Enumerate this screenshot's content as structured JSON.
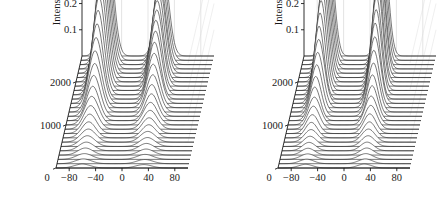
{
  "figure": {
    "background": "#ffffff",
    "panel_count": 2
  },
  "chart_data": [
    {
      "type": "line",
      "subtype": "waterfall-3d",
      "panel": "left",
      "title": "",
      "xlabel": "",
      "ylabel": "Intensity (W)",
      "zlabel": "",
      "xlim": [
        -100,
        100
      ],
      "ylim": [
        0,
        0.45
      ],
      "zlim": [
        0,
        2600
      ],
      "xticks": [
        -80,
        -40,
        0,
        40,
        80
      ],
      "xticklabels": [
        "−80",
        "−40",
        "0",
        "40",
        "80"
      ],
      "yticks": [
        0.1,
        0.2,
        0.3,
        0.4
      ],
      "yticklabels": [
        "0.1",
        "0.2",
        "0.3",
        "0.4"
      ],
      "zticks": [
        0,
        1000,
        2000
      ],
      "zticklabels": [
        "0",
        "1000",
        "2000"
      ],
      "grid": true,
      "legend": null,
      "n_traces": 27,
      "peaks": [
        {
          "name": "left-peak",
          "center": -62,
          "max_amplitude": 0.46,
          "width": 13
        },
        {
          "name": "right-peak",
          "center": 22,
          "max_amplitude": 0.35,
          "width": 13
        }
      ],
      "series_note": "Stacked spectra; each trace offset along the round-trip axis from 0 to 2600.",
      "traces": [
        {
          "z": 0,
          "left_amp": 0.015,
          "left_center": -60,
          "left_width": 17,
          "right_amp": 0.013,
          "right_center": 33,
          "right_width": 17
        },
        {
          "z": 100,
          "left_amp": 0.018,
          "left_center": -60,
          "left_width": 17,
          "right_amp": 0.016,
          "right_center": 33,
          "right_width": 17
        },
        {
          "z": 200,
          "left_amp": 0.022,
          "left_center": -60,
          "left_width": 17,
          "right_amp": 0.019,
          "right_center": 32,
          "right_width": 17
        },
        {
          "z": 300,
          "left_amp": 0.027,
          "left_center": -60,
          "left_width": 16,
          "right_amp": 0.023,
          "right_center": 32,
          "right_width": 16
        },
        {
          "z": 400,
          "left_amp": 0.033,
          "left_center": -60,
          "left_width": 16,
          "right_amp": 0.028,
          "right_center": 31,
          "right_width": 16
        },
        {
          "z": 500,
          "left_amp": 0.041,
          "left_center": -60,
          "left_width": 16,
          "right_amp": 0.034,
          "right_center": 31,
          "right_width": 16
        },
        {
          "z": 600,
          "left_amp": 0.05,
          "left_center": -60,
          "left_width": 16,
          "right_amp": 0.041,
          "right_center": 30,
          "right_width": 16
        },
        {
          "z": 700,
          "left_amp": 0.061,
          "left_center": -61,
          "left_width": 15,
          "right_amp": 0.05,
          "right_center": 30,
          "right_width": 15
        },
        {
          "z": 800,
          "left_amp": 0.074,
          "left_center": -61,
          "left_width": 15,
          "right_amp": 0.06,
          "right_center": 29,
          "right_width": 15
        },
        {
          "z": 900,
          "left_amp": 0.09,
          "left_center": -61,
          "left_width": 15,
          "right_amp": 0.072,
          "right_center": 29,
          "right_width": 15
        },
        {
          "z": 1000,
          "left_amp": 0.109,
          "left_center": -61,
          "left_width": 15,
          "right_amp": 0.086,
          "right_center": 28,
          "right_width": 15
        },
        {
          "z": 1100,
          "left_amp": 0.131,
          "left_center": -61,
          "left_width": 14,
          "right_amp": 0.102,
          "right_center": 28,
          "right_width": 14
        },
        {
          "z": 1200,
          "left_amp": 0.156,
          "left_center": -61,
          "left_width": 14,
          "right_amp": 0.121,
          "right_center": 27,
          "right_width": 14
        },
        {
          "z": 1300,
          "left_amp": 0.185,
          "left_center": -61,
          "left_width": 14,
          "right_amp": 0.142,
          "right_center": 27,
          "right_width": 14
        },
        {
          "z": 1400,
          "left_amp": 0.217,
          "left_center": -62,
          "left_width": 14,
          "right_amp": 0.166,
          "right_center": 26,
          "right_width": 14
        },
        {
          "z": 1500,
          "left_amp": 0.251,
          "left_center": -62,
          "left_width": 14,
          "right_amp": 0.191,
          "right_center": 26,
          "right_width": 14
        },
        {
          "z": 1600,
          "left_amp": 0.287,
          "left_center": -62,
          "left_width": 13,
          "right_amp": 0.217,
          "right_center": 25,
          "right_width": 13
        },
        {
          "z": 1700,
          "left_amp": 0.322,
          "left_center": -62,
          "left_width": 13,
          "right_amp": 0.243,
          "right_center": 25,
          "right_width": 13
        },
        {
          "z": 1800,
          "left_amp": 0.356,
          "left_center": -62,
          "left_width": 13,
          "right_amp": 0.268,
          "right_center": 24,
          "right_width": 13
        },
        {
          "z": 1900,
          "left_amp": 0.387,
          "left_center": -62,
          "left_width": 13,
          "right_amp": 0.291,
          "right_center": 24,
          "right_width": 13
        },
        {
          "z": 2000,
          "left_amp": 0.412,
          "left_center": -62,
          "left_width": 13,
          "right_amp": 0.31,
          "right_center": 23,
          "right_width": 13
        },
        {
          "z": 2100,
          "left_amp": 0.432,
          "left_center": -62,
          "left_width": 13,
          "right_amp": 0.325,
          "right_center": 23,
          "right_width": 13
        },
        {
          "z": 2200,
          "left_amp": 0.445,
          "left_center": -62,
          "left_width": 13,
          "right_amp": 0.336,
          "right_center": 23,
          "right_width": 13
        },
        {
          "z": 2300,
          "left_amp": 0.454,
          "left_center": -62,
          "left_width": 13,
          "right_amp": 0.344,
          "right_center": 22,
          "right_width": 13
        },
        {
          "z": 2400,
          "left_amp": 0.459,
          "left_center": -62,
          "left_width": 13,
          "right_amp": 0.348,
          "right_center": 22,
          "right_width": 13
        },
        {
          "z": 2500,
          "left_amp": 0.461,
          "left_center": -62,
          "left_width": 13,
          "right_amp": 0.35,
          "right_center": 22,
          "right_width": 13
        },
        {
          "z": 2600,
          "left_amp": 0.462,
          "left_center": -62,
          "left_width": 13,
          "right_amp": 0.351,
          "right_center": 22,
          "right_width": 13
        }
      ]
    },
    {
      "type": "line",
      "subtype": "waterfall-3d",
      "panel": "right",
      "title": "",
      "xlabel": "",
      "ylabel": "Intensity (W)",
      "zlabel": "",
      "xlim": [
        -100,
        100
      ],
      "ylim": [
        0,
        0.45
      ],
      "zlim": [
        0,
        2600
      ],
      "xticks": [
        -80,
        -40,
        0,
        40,
        80
      ],
      "xticklabels": [
        "−80",
        "−40",
        "0",
        "40",
        "80"
      ],
      "yticks": [
        0.1,
        0.2,
        0.3,
        0.4
      ],
      "yticklabels": [
        "0.1",
        "0.2",
        "0.3",
        "0.4"
      ],
      "zticks": [
        0,
        1000,
        2000
      ],
      "zticklabels": [
        "0",
        "1000",
        "2000"
      ],
      "grid": true,
      "legend": null,
      "n_traces": 27,
      "peaks": [
        {
          "name": "left-peak",
          "center": -62,
          "max_amplitude": 0.4,
          "width": 11
        },
        {
          "name": "right-peak",
          "center": 20,
          "max_amplitude": 0.42,
          "width": 11
        }
      ],
      "series_note": "Stacked spectra; both pulses reach comparable peak intensity with flat-topped pedestals.",
      "traces": [
        {
          "z": 0,
          "left_amp": 0.014,
          "left_center": -58,
          "left_width": 15,
          "right_amp": 0.015,
          "right_center": 31,
          "right_width": 15
        },
        {
          "z": 100,
          "left_amp": 0.017,
          "left_center": -58,
          "left_width": 15,
          "right_amp": 0.018,
          "right_center": 31,
          "right_width": 15
        },
        {
          "z": 200,
          "left_amp": 0.021,
          "left_center": -58,
          "left_width": 15,
          "right_amp": 0.022,
          "right_center": 30,
          "right_width": 15
        },
        {
          "z": 300,
          "left_amp": 0.026,
          "left_center": -59,
          "left_width": 14,
          "right_amp": 0.027,
          "right_center": 30,
          "right_width": 14
        },
        {
          "z": 400,
          "left_amp": 0.032,
          "left_center": -59,
          "left_width": 14,
          "right_amp": 0.033,
          "right_center": 29,
          "right_width": 14
        },
        {
          "z": 500,
          "left_amp": 0.039,
          "left_center": -59,
          "left_width": 14,
          "right_amp": 0.041,
          "right_center": 29,
          "right_width": 14
        },
        {
          "z": 600,
          "left_amp": 0.048,
          "left_center": -59,
          "left_width": 14,
          "right_amp": 0.05,
          "right_center": 28,
          "right_width": 14
        },
        {
          "z": 700,
          "left_amp": 0.059,
          "left_center": -60,
          "left_width": 13,
          "right_amp": 0.061,
          "right_center": 28,
          "right_width": 13
        },
        {
          "z": 800,
          "left_amp": 0.072,
          "left_center": -60,
          "left_width": 13,
          "right_amp": 0.075,
          "right_center": 27,
          "right_width": 13
        },
        {
          "z": 900,
          "left_amp": 0.088,
          "left_center": -60,
          "left_width": 13,
          "right_amp": 0.091,
          "right_center": 27,
          "right_width": 13
        },
        {
          "z": 1000,
          "left_amp": 0.106,
          "left_center": -60,
          "left_width": 13,
          "right_amp": 0.11,
          "right_center": 26,
          "right_width": 13
        },
        {
          "z": 1100,
          "left_amp": 0.128,
          "left_center": -61,
          "left_width": 12,
          "right_amp": 0.133,
          "right_center": 26,
          "right_width": 12
        },
        {
          "z": 1200,
          "left_amp": 0.152,
          "left_center": -61,
          "left_width": 12,
          "right_amp": 0.158,
          "right_center": 25,
          "right_width": 12
        },
        {
          "z": 1300,
          "left_amp": 0.18,
          "left_center": -61,
          "left_width": 12,
          "right_amp": 0.187,
          "right_center": 25,
          "right_width": 12
        },
        {
          "z": 1400,
          "left_amp": 0.211,
          "left_center": -61,
          "left_width": 12,
          "right_amp": 0.219,
          "right_center": 24,
          "right_width": 12
        },
        {
          "z": 1500,
          "left_amp": 0.244,
          "left_center": -61,
          "left_width": 12,
          "right_amp": 0.254,
          "right_center": 24,
          "right_width": 12
        },
        {
          "z": 1600,
          "left_amp": 0.278,
          "left_center": -62,
          "left_width": 11,
          "right_amp": 0.29,
          "right_center": 23,
          "right_width": 11
        },
        {
          "z": 1700,
          "left_amp": 0.312,
          "left_center": -62,
          "left_width": 11,
          "right_amp": 0.325,
          "right_center": 23,
          "right_width": 11
        },
        {
          "z": 1800,
          "left_amp": 0.343,
          "left_center": -62,
          "left_width": 11,
          "right_amp": 0.357,
          "right_center": 22,
          "right_width": 11
        },
        {
          "z": 1900,
          "left_amp": 0.369,
          "left_center": -62,
          "left_width": 11,
          "right_amp": 0.384,
          "right_center": 22,
          "right_width": 11
        },
        {
          "z": 2000,
          "left_amp": 0.387,
          "left_center": -62,
          "left_width": 11,
          "right_amp": 0.403,
          "right_center": 21,
          "right_width": 11
        },
        {
          "z": 2100,
          "left_amp": 0.398,
          "left_center": -62,
          "left_width": 11,
          "right_amp": 0.414,
          "right_center": 21,
          "right_width": 11
        },
        {
          "z": 2200,
          "left_amp": 0.404,
          "left_center": -62,
          "left_width": 11,
          "right_amp": 0.42,
          "right_center": 21,
          "right_width": 11
        },
        {
          "z": 2300,
          "left_amp": 0.407,
          "left_center": -62,
          "left_width": 11,
          "right_amp": 0.423,
          "right_center": 20,
          "right_width": 11
        },
        {
          "z": 2400,
          "left_amp": 0.408,
          "left_center": -62,
          "left_width": 11,
          "right_amp": 0.425,
          "right_center": 20,
          "right_width": 11
        },
        {
          "z": 2500,
          "left_amp": 0.409,
          "left_center": -62,
          "left_width": 11,
          "right_amp": 0.425,
          "right_center": 20,
          "right_width": 11
        },
        {
          "z": 2600,
          "left_amp": 0.409,
          "left_center": -62,
          "left_width": 11,
          "right_amp": 0.426,
          "right_center": 20,
          "right_width": 11
        }
      ]
    }
  ]
}
